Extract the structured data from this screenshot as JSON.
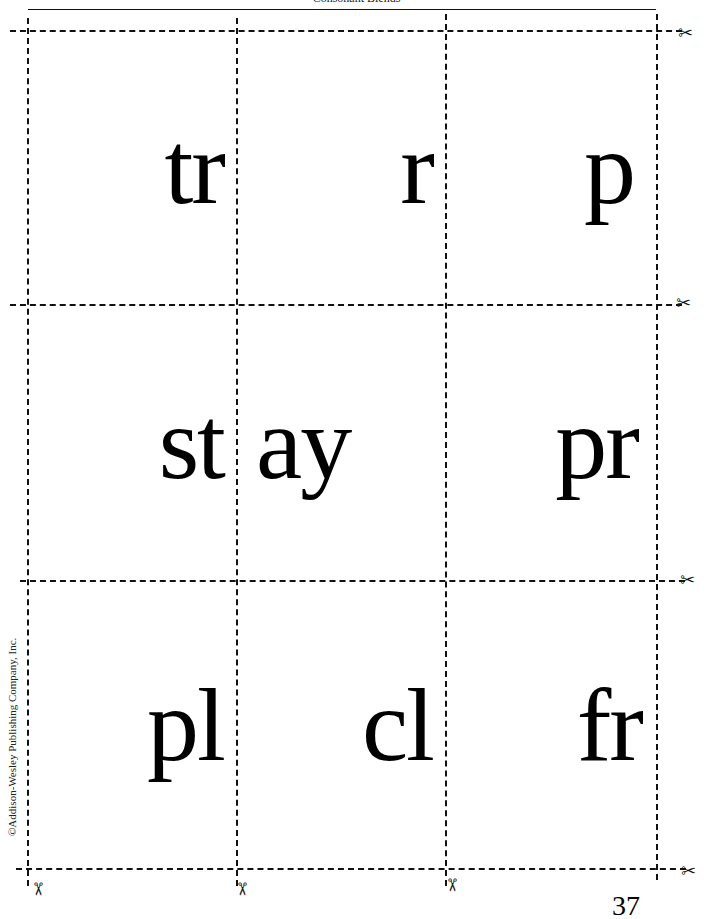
{
  "header": {
    "title": "Consonant Blends"
  },
  "cards": [
    {
      "row": 0,
      "col": 0,
      "text": "tr",
      "align": "right"
    },
    {
      "row": 0,
      "col": 1,
      "text": "r",
      "align": "right"
    },
    {
      "row": 0,
      "col": 2,
      "text": "p",
      "align": "right"
    },
    {
      "row": 1,
      "col": 0,
      "text": "st",
      "align": "right"
    },
    {
      "row": 1,
      "col": 1,
      "text": "ay",
      "align": "left"
    },
    {
      "row": 1,
      "col": 2,
      "text": "pr",
      "align": "right"
    },
    {
      "row": 2,
      "col": 0,
      "text": "pl",
      "align": "right"
    },
    {
      "row": 2,
      "col": 1,
      "text": "cl",
      "align": "right"
    },
    {
      "row": 2,
      "col": 2,
      "text": "fr",
      "align": "right"
    }
  ],
  "icons": {
    "scissors": "✂"
  },
  "footer": {
    "copyright": "©Addison-Wesley Publishing Company, Inc.",
    "page_number": "37"
  }
}
